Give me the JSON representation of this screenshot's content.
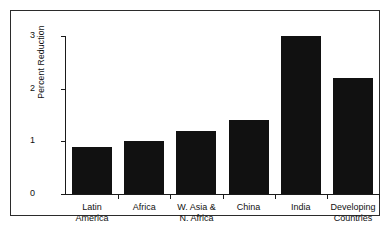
{
  "chart_data": {
    "type": "bar",
    "title": "",
    "subtitle": "",
    "xlabel": "",
    "ylabel": "Percent Reduction",
    "ylim": [
      0,
      3
    ],
    "yticks": [
      "0",
      "1",
      "2",
      "3"
    ],
    "ytick_values": [
      0,
      1,
      2,
      3
    ],
    "grid": false,
    "legend": null,
    "categories": [
      "Latin America",
      "Africa",
      "W. Asia & N. Africa",
      "China",
      "India",
      "Developing Countries"
    ],
    "category_lines": [
      [
        "Latin",
        "America"
      ],
      [
        "Africa",
        ""
      ],
      [
        "W. Asia &",
        "N. Africa"
      ],
      [
        "China",
        ""
      ],
      [
        "India",
        ""
      ],
      [
        "Developing",
        "Countries"
      ]
    ],
    "values": [
      0.9,
      1.0,
      1.2,
      1.4,
      3.0,
      2.2
    ],
    "bar_color": "#111111",
    "axis_color": "#1a1a1a",
    "background": "#ffffff"
  },
  "figure": {
    "frame_border_color": "#2b2b2b"
  }
}
